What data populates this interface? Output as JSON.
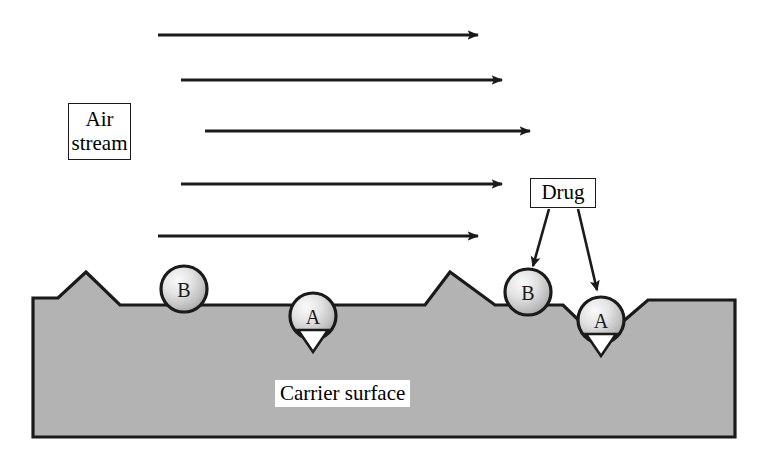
{
  "diagram": {
    "background_color": "#ffffff",
    "surface_fill": "#b3b3b3",
    "outline_color": "#1a1a1a",
    "particle_fill_light": "#f2f2f2",
    "particle_fill_dark": "#9e9e9e",
    "arrow_color": "#1a1a1a"
  },
  "labels": {
    "air_stream": "Air\nstream",
    "drug": "Drug",
    "carrier_surface": "Carrier surface"
  },
  "airflow_arrows": [
    {
      "id": "arrow-1",
      "x1": 158,
      "y1": 35,
      "x2": 478,
      "y2": 35
    },
    {
      "id": "arrow-2",
      "x1": 181,
      "y1": 80,
      "x2": 502,
      "y2": 80
    },
    {
      "id": "arrow-3",
      "x1": 205,
      "y1": 131,
      "x2": 530,
      "y2": 131
    },
    {
      "id": "arrow-4",
      "x1": 181,
      "y1": 184,
      "x2": 502,
      "y2": 184
    },
    {
      "id": "arrow-5",
      "x1": 158,
      "y1": 236,
      "x2": 478,
      "y2": 236
    }
  ],
  "drug_leader_arrows": [
    {
      "id": "drug-leader-to-b",
      "x1": 549,
      "y1": 209,
      "x2": 533,
      "y2": 266
    },
    {
      "id": "drug-leader-to-a",
      "x1": 578,
      "y1": 209,
      "x2": 597,
      "y2": 290
    }
  ],
  "particles": [
    {
      "id": "particle-b-left",
      "letter": "B",
      "cx": 184,
      "cy": 289,
      "r": 23,
      "seat": "flat-ledge"
    },
    {
      "id": "particle-a-left",
      "letter": "A",
      "cx": 313,
      "cy": 316,
      "r": 23,
      "seat": "v-notch"
    },
    {
      "id": "particle-b-right",
      "letter": "B",
      "cx": 528,
      "cy": 292,
      "r": 23,
      "seat": "flat-ledge"
    },
    {
      "id": "particle-a-right",
      "letter": "A",
      "cx": 601,
      "cy": 320,
      "r": 23,
      "seat": "v-notch"
    }
  ],
  "carrier_profile": {
    "description": "Jagged carrier surface cross-section: two triangular peaks and two V-shaped notches",
    "points": "33,305 33,437 735,437 735,300 648,300 612,331 601,343 590,331 563,305 495,305 450,272 425,305 345,305 326,305 313,343 300,305 205,305 160,305 120,305 86,272 58,298 33,298",
    "baseline_y": 437,
    "left_x": 33,
    "right_x": 735
  },
  "notch_gaps": [
    {
      "id": "notch-gap-left",
      "points": "298,330 328,330 313,352"
    },
    {
      "id": "notch-gap-right",
      "points": "586,334 616,334 601,356"
    }
  ]
}
